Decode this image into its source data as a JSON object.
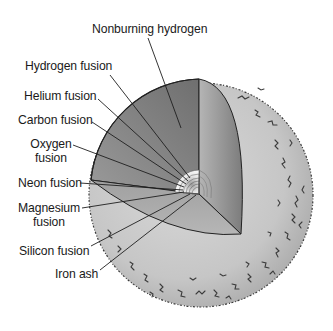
{
  "diagram": {
    "colors": {
      "background": "#ffffff",
      "envelope": "#c4c4c4",
      "envelope_edge": "#333333",
      "wedge_dark": "#8a8a8a",
      "wedge_light": "#b8b8b8",
      "core": "#f2f2f2",
      "line": "#222222"
    },
    "labels": {
      "nonburning_hydrogen": "Nonburning hydrogen",
      "hydrogen_fusion": "Hydrogen fusion",
      "helium_fusion": "Helium fusion",
      "carbon_fusion": "Carbon fusion",
      "oxygen_fusion_line1": "Oxygen",
      "oxygen_fusion_line2": "fusion",
      "neon_fusion": "Neon fusion",
      "magnesium_fusion_line1": "Magnesium",
      "magnesium_fusion_line2": "fusion",
      "silicon_fusion": "Silicon fusion",
      "iron_ash": "Iron ash"
    }
  }
}
